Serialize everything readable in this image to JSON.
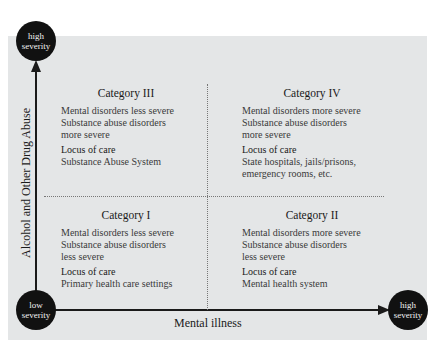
{
  "axes": {
    "y_label": "Alcohol and Other Drug Abuse",
    "x_label": "Mental illness",
    "y_top": {
      "line1": "high",
      "line2": "severity"
    },
    "origin": {
      "line1": "low",
      "line2": "severity"
    },
    "x_right": {
      "line1": "high",
      "line2": "severity"
    }
  },
  "quadrants": {
    "q3": {
      "title": "Category III",
      "lines": [
        "Mental disorders less severe",
        "Substance abuse disorders",
        "more severe"
      ],
      "locus_label": "Locus of care",
      "locus": [
        "Substance Abuse System"
      ]
    },
    "q4": {
      "title": "Category IV",
      "lines": [
        "Mental disorders more severe",
        "Substance abuse disorders",
        "more severe"
      ],
      "locus_label": "Locus of care",
      "locus": [
        "State hospitals, jails/prisons,",
        "emergency rooms, etc."
      ]
    },
    "q1": {
      "title": "Category I",
      "lines": [
        "Mental disorders less severe",
        "Substance abuse disorders",
        "less severe"
      ],
      "locus_label": "Locus of care",
      "locus": [
        "Primary health care settings"
      ]
    },
    "q2": {
      "title": "Category II",
      "lines": [
        "Mental disorders more severe",
        "Substance abuse disorders",
        "less severe"
      ],
      "locus_label": "Locus of care",
      "locus": [
        "Mental health system"
      ]
    }
  }
}
